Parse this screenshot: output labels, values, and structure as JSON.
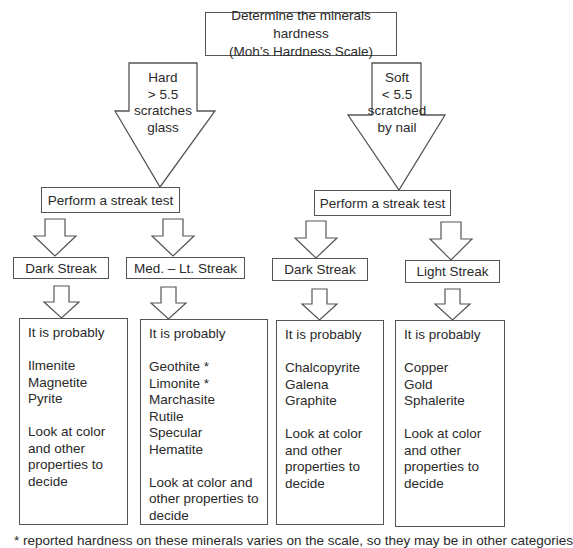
{
  "diagram": {
    "title": {
      "line1": "Determine the minerals hardness",
      "line2": "(Moh’s Hardness Scale)"
    },
    "branches": [
      {
        "id": "hard",
        "arrow_label": [
          "Hard",
          "> 5.5",
          "scratches",
          "glass"
        ],
        "streak_test_label": "Perform a streak test",
        "streaks": [
          {
            "label": "Dark Streak",
            "result": {
              "intro": "It is probably",
              "minerals": [
                "Ilmenite",
                "Magnetite",
                "Pyrite"
              ],
              "advice": [
                "Look at color",
                "and other",
                "properties to",
                "decide"
              ]
            }
          },
          {
            "label": "Med. – Lt. Streak",
            "result": {
              "intro": "It is probably",
              "minerals": [
                "Geothite *",
                "Limonite *",
                "Marchasite",
                "Rutile",
                "Specular Hematite"
              ],
              "advice": [
                "Look at color and",
                "other properties to",
                "decide"
              ]
            }
          }
        ]
      },
      {
        "id": "soft",
        "arrow_label": [
          "Soft",
          "< 5.5",
          "scratched",
          "by nail"
        ],
        "streak_test_label": "Perform a streak test",
        "streaks": [
          {
            "label": "Dark Streak",
            "result": {
              "intro": "It is probably",
              "minerals": [
                "Chalcopyrite",
                "Galena",
                "Graphite"
              ],
              "advice": [
                "Look at color",
                "and other",
                "properties to",
                "decide"
              ]
            }
          },
          {
            "label": "Light Streak",
            "result": {
              "intro": "It is probably",
              "minerals": [
                "Copper",
                "Gold",
                "Sphalerite"
              ],
              "advice": [
                "Look at color",
                "and other",
                "properties to",
                "decide"
              ]
            }
          }
        ]
      }
    ],
    "footnote": "* reported hardness on these minerals varies on the scale, so they may be in other categories"
  },
  "colors": {
    "stroke": "#555555",
    "text": "#2a2a2a",
    "background": "#ffffff"
  }
}
